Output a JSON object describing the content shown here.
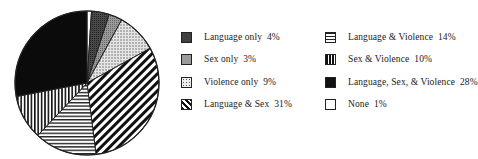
{
  "chart_data": {
    "type": "pie",
    "title": "",
    "start_angle_deg": 0,
    "direction": "clockwise",
    "slices": [
      {
        "label": "None",
        "value": 1,
        "pattern": "white",
        "color": "#ffffff"
      },
      {
        "label": "Language only",
        "value": 4,
        "pattern": "dark-gray",
        "color": "#3a3a3a"
      },
      {
        "label": "Sex only",
        "value": 3,
        "pattern": "medium-gray",
        "color": "#8a8a8a"
      },
      {
        "label": "Violence only",
        "value": 9,
        "pattern": "dots",
        "color": "#d8d8d8"
      },
      {
        "label": "Language & Sex",
        "value": 31,
        "pattern": "diagonal-stripes",
        "color": "#1a1a1a"
      },
      {
        "label": "Language & Violence",
        "value": 14,
        "pattern": "horizontal-stripes",
        "color": "#1a1a1a"
      },
      {
        "label": "Sex & Violence",
        "value": 10,
        "pattern": "vertical-stripes",
        "color": "#1a1a1a"
      },
      {
        "label": "Language, Sex, & Violence",
        "value": 28,
        "pattern": "solid-black",
        "color": "#0a0a0a"
      }
    ],
    "legend_position": "right",
    "legend": [
      "Language only  4%",
      "Sex only  3%",
      "Violence only  9%",
      "Language & Sex  31%",
      "Language & Violence  14%",
      "Sex & Violence  10%",
      "Language, Sex, & Violence  28%",
      "None  1%"
    ]
  },
  "legend": {
    "left": [
      {
        "label": "Language only  4%",
        "pattern": "dark-gray"
      },
      {
        "label": "Sex only  3%",
        "pattern": "medium-gray"
      },
      {
        "label": "Violence only  9%",
        "pattern": "dots"
      },
      {
        "label": "Language & Sex  31%",
        "pattern": "diagonal-stripes"
      }
    ],
    "right": [
      {
        "label": "Language & Violence  14%",
        "pattern": "horizontal-stripes"
      },
      {
        "label": "Sex & Violence  10%",
        "pattern": "vertical-stripes"
      },
      {
        "label": "Language, Sex, & Violence  28%",
        "pattern": "solid-black"
      },
      {
        "label": "None  1%",
        "pattern": "white"
      }
    ]
  }
}
